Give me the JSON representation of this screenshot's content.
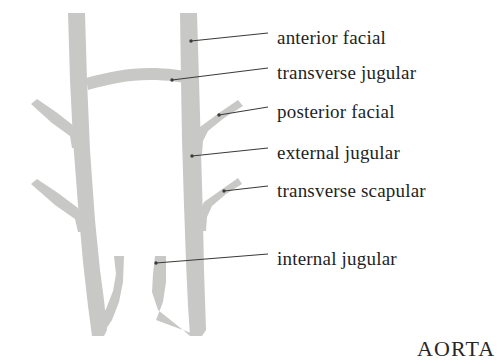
{
  "figure": {
    "type": "anatomical-diagram",
    "background_color": "#ffffff",
    "vessel_color": "#c8c9c6",
    "leader_line_color": "#3a3a3a",
    "text_color": "#231f1f"
  },
  "labels": [
    {
      "id": "anterior-facial",
      "text": "anterior facial",
      "text_x": 277,
      "text_y": 27,
      "leader_x1": 200,
      "leader_y1": 39,
      "leader_x2": 268,
      "leader_y2": 39,
      "dot_x": 191,
      "dot_y": 41
    },
    {
      "id": "transverse-jugular",
      "text": "transverse jugular",
      "text_x": 277,
      "text_y": 62,
      "leader_x1": 178,
      "leader_y1": 79,
      "leader_x2": 268,
      "leader_y2": 74,
      "dot_x": 172,
      "dot_y": 80
    },
    {
      "id": "posterior-facial",
      "text": "posterior facial",
      "text_x": 277,
      "text_y": 101,
      "leader_x1": 223,
      "leader_y1": 114,
      "leader_x2": 268,
      "leader_y2": 110,
      "dot_x": 219,
      "dot_y": 115
    },
    {
      "id": "external-jugular",
      "text": "external jugular",
      "text_x": 277,
      "text_y": 142,
      "leader_x1": 196,
      "leader_y1": 155,
      "leader_x2": 268,
      "leader_y2": 152,
      "dot_x": 192,
      "dot_y": 156
    },
    {
      "id": "transverse-scapular",
      "text": "transverse scapular",
      "text_x": 277,
      "text_y": 180,
      "leader_x1": 228,
      "leader_y1": 190,
      "leader_x2": 268,
      "leader_y2": 188,
      "dot_x": 224,
      "dot_y": 191
    },
    {
      "id": "internal-jugular",
      "text": "internal jugular",
      "text_x": 277,
      "text_y": 248,
      "leader_x1": 158,
      "leader_y1": 263,
      "leader_x2": 268,
      "leader_y2": 261,
      "dot_x": 156,
      "dot_y": 263
    }
  ],
  "aorta": {
    "text": "AORTA",
    "x": 417,
    "y": 336
  },
  "vessels": {
    "left_trunk": "left external jugular trunk",
    "right_trunk": "right external jugular trunk",
    "arch": "transverse jugular arch",
    "left_branches": [
      "upper oblique branch",
      "lower oblique branch"
    ],
    "right_branches": [
      "posterior facial branch",
      "transverse scapular branch"
    ],
    "left_internal": "left internal jugular",
    "right_internal": "right internal jugular"
  }
}
